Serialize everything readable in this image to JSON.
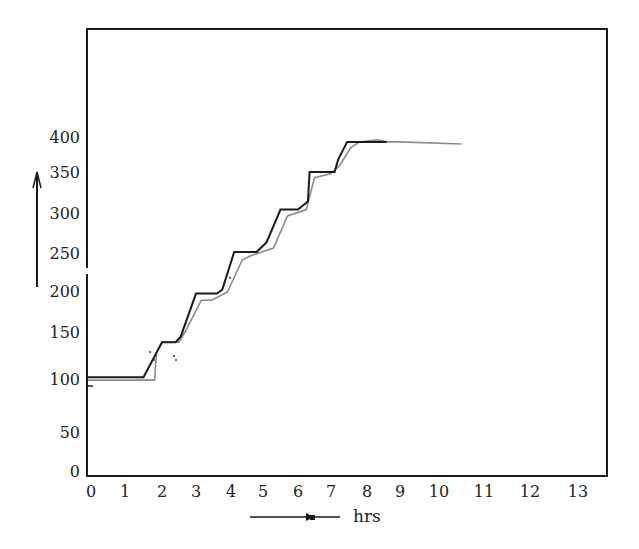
{
  "chart_data": {
    "type": "line",
    "title": "",
    "xlabel": "hrs",
    "ylabel": "",
    "xlim": [
      0,
      13
    ],
    "ylim": [
      0,
      400
    ],
    "grid": false,
    "legend": null,
    "x_ticks": [
      "0",
      "1",
      "2",
      "3",
      "4",
      "5",
      "6",
      "7",
      "8",
      "9",
      "10",
      "11",
      "12",
      "13"
    ],
    "y_ticks": [
      "0",
      "50",
      "100",
      "150",
      "200",
      "250",
      "300",
      "350",
      "400"
    ],
    "series": [
      {
        "name": "dark step line",
        "color": "#1a1a1a",
        "x": [
          0,
          1.5,
          2.0,
          2.4,
          2.55,
          3.0,
          3.6,
          3.75,
          4.1,
          4.8,
          5.1,
          5.5,
          6.0,
          6.3,
          6.35,
          7.1,
          7.2,
          7.45,
          7.95,
          8.6
        ],
        "y": [
          102,
          102,
          140,
          140,
          146,
          198,
          198,
          203,
          250,
          250,
          262,
          303,
          303,
          313,
          350,
          350,
          368,
          393,
          393,
          393
        ]
      },
      {
        "name": "gray step line",
        "color": "#8a8a8a",
        "x": [
          0,
          1.8,
          1.85,
          2.0,
          2.5,
          2.7,
          3.15,
          3.45,
          3.9,
          4.35,
          4.6,
          5.3,
          5.7,
          6.25,
          6.5,
          7.0,
          7.25,
          7.55,
          7.8,
          8.3,
          8.6,
          9.0,
          10.5
        ],
        "y": [
          99,
          99,
          128,
          140,
          140,
          153,
          190,
          190,
          200,
          240,
          245,
          255,
          295,
          303,
          343,
          348,
          360,
          385,
          393,
          396,
          393,
          393,
          390
        ]
      }
    ],
    "annotations": [
      {
        "type": "arrow",
        "direction": "up",
        "note": "y-axis arrow beside 200–350 labels"
      },
      {
        "type": "arrow",
        "direction": "right",
        "label": "hrs"
      }
    ]
  },
  "labels": {
    "x_axis_unit": "hrs",
    "x_ticks": [
      {
        "label": "0",
        "px": 91
      },
      {
        "label": "1",
        "px": 125
      },
      {
        "label": "2",
        "px": 162
      },
      {
        "label": "3",
        "px": 196
      },
      {
        "label": "4",
        "px": 231
      },
      {
        "label": "5",
        "px": 263
      },
      {
        "label": "6",
        "px": 298
      },
      {
        "label": "7",
        "px": 331
      },
      {
        "label": "8",
        "px": 367
      },
      {
        "label": "9",
        "px": 400
      },
      {
        "label": "10",
        "px": 439
      },
      {
        "label": "11",
        "px": 484
      },
      {
        "label": "12",
        "px": 530
      },
      {
        "label": "13",
        "px": 578
      }
    ],
    "y_ticks": [
      {
        "label": "400",
        "py": 143
      },
      {
        "label": "350",
        "py": 178
      },
      {
        "label": "300",
        "py": 219
      },
      {
        "label": "250",
        "py": 259
      },
      {
        "label": "200",
        "py": 297
      },
      {
        "label": "150",
        "py": 338
      },
      {
        "label": "100",
        "py": 385
      },
      {
        "label": "50",
        "py": 438
      },
      {
        "label": "0",
        "py": 477
      }
    ]
  }
}
